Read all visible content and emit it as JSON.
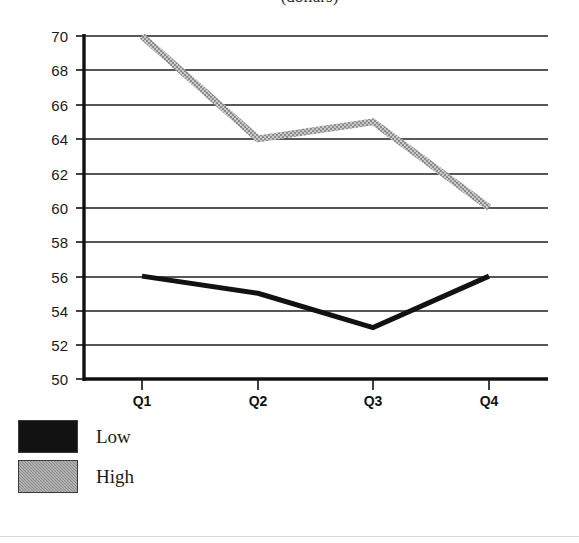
{
  "chart_data": {
    "type": "line",
    "title": "(dollars)",
    "subtitle": "",
    "xlabel": "",
    "ylabel": "",
    "categories": [
      "Q1",
      "Q2",
      "Q3",
      "Q4"
    ],
    "series": [
      {
        "name": "Low",
        "color": "#121212",
        "values": [
          56,
          55,
          53,
          56
        ]
      },
      {
        "name": "High",
        "color": "#8d8d8d",
        "values": [
          70,
          64,
          65,
          60
        ]
      }
    ],
    "ylim": [
      50,
      70
    ],
    "ytick_step": 2,
    "ytick_labels": [
      "70",
      "68",
      "66",
      "64",
      "62",
      "60",
      "58",
      "56",
      "54",
      "52",
      "50"
    ],
    "grid": true,
    "grid_axis": "y",
    "legend_position": "bottom-left",
    "legend_entries": [
      {
        "label": "Low",
        "swatch": "black"
      },
      {
        "label": "High",
        "swatch": "gray"
      }
    ]
  },
  "axes": {
    "y_ticks": [
      {
        "label": "70",
        "value": 70
      },
      {
        "label": "68",
        "value": 68
      },
      {
        "label": "66",
        "value": 66
      },
      {
        "label": "64",
        "value": 64
      },
      {
        "label": "62",
        "value": 62
      },
      {
        "label": "60",
        "value": 60
      },
      {
        "label": "58",
        "value": 58
      },
      {
        "label": "56",
        "value": 56
      },
      {
        "label": "54",
        "value": 54
      },
      {
        "label": "52",
        "value": 52
      },
      {
        "label": "50",
        "value": 50
      }
    ],
    "x_ticks": [
      {
        "label": "Q1"
      },
      {
        "label": "Q2"
      },
      {
        "label": "Q3"
      },
      {
        "label": "Q4"
      }
    ]
  },
  "legend": {
    "items": [
      {
        "label": "Low"
      },
      {
        "label": "High"
      }
    ]
  }
}
